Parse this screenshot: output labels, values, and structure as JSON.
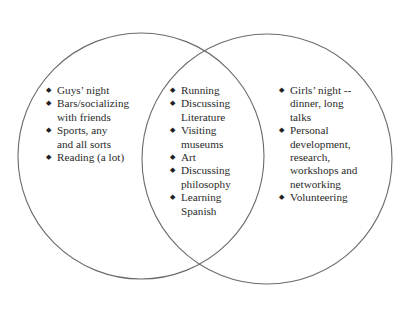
{
  "diagram": {
    "type": "venn",
    "stroke_color": "#6b6b6b",
    "background": "#ffffff",
    "circles": [
      {
        "name": "left",
        "cx": 141,
        "cy": 156,
        "r": 123
      },
      {
        "name": "right",
        "cx": 267,
        "cy": 159,
        "r": 125
      }
    ],
    "bullet_glyph": "◆",
    "sections": {
      "left": {
        "items": [
          {
            "text": "Guys’ night"
          },
          {
            "text": "Bars/socializing with friends"
          },
          {
            "text": "Sports, any and all sorts"
          },
          {
            "text": "Reading (a lot)"
          }
        ]
      },
      "center": {
        "items": [
          {
            "text": "Running"
          },
          {
            "text": "Discussing Literature"
          },
          {
            "text": "Visiting museums"
          },
          {
            "text": "Art"
          },
          {
            "text": "Discussing philosophy"
          },
          {
            "text": "Learning Spanish"
          }
        ]
      },
      "right": {
        "items": [
          {
            "text": "Girls’ night -- dinner, long talks"
          },
          {
            "text": "Personal development, research, workshops and networking"
          },
          {
            "text": "Volunteering"
          }
        ]
      }
    }
  }
}
